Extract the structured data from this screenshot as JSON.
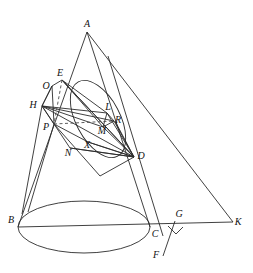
{
  "figure": {
    "stroke_color": "#2b2b2b",
    "dashed_color": "#4a4a4a",
    "background": "#ffffff",
    "stroke_width": 0.9,
    "width": 253,
    "height": 273
  },
  "points": {
    "A": {
      "label": "A",
      "x": 87,
      "y": 32,
      "lx": 87,
      "ly": 24
    },
    "B": {
      "label": "B",
      "x": 18,
      "y": 227,
      "lx": 11,
      "ly": 220
    },
    "C": {
      "label": "C",
      "x": 150,
      "y": 227,
      "lx": 155,
      "ly": 234
    },
    "D": {
      "label": "D",
      "x": 134,
      "y": 157,
      "lx": 141,
      "ly": 156
    },
    "E": {
      "label": "E",
      "x": 62,
      "y": 80,
      "lx": 60,
      "ly": 73
    },
    "F": {
      "label": "F",
      "x": 163,
      "y": 256,
      "lx": 156,
      "ly": 255
    },
    "G": {
      "label": "G",
      "x": 175,
      "y": 221,
      "lx": 179,
      "ly": 214
    },
    "H": {
      "label": "H",
      "x": 42,
      "y": 106,
      "lx": 33,
      "ly": 105
    },
    "K": {
      "label": "K",
      "x": 233,
      "y": 222,
      "lx": 238,
      "ly": 222
    },
    "L": {
      "label": "L",
      "x": 107,
      "y": 113,
      "lx": 108,
      "ly": 107
    },
    "M": {
      "label": "M",
      "x": 103,
      "y": 127,
      "lx": 102,
      "ly": 131
    },
    "N": {
      "label": "N",
      "x": 70,
      "y": 148,
      "lx": 68,
      "ly": 153
    },
    "O": {
      "label": "O",
      "x": 52,
      "y": 86,
      "lx": 46,
      "ly": 86
    },
    "P": {
      "label": "P",
      "x": 54,
      "y": 124,
      "lx": 46,
      "ly": 127
    },
    "R": {
      "label": "R",
      "x": 114,
      "y": 121,
      "lx": 118,
      "ly": 120
    },
    "X": {
      "label": "X",
      "x": 88,
      "y": 142,
      "lx": 87,
      "ly": 145
    }
  },
  "base_ellipse": {
    "name": "cone-base-ellipse",
    "cx": 84,
    "cy": 227,
    "rx": 66,
    "ry": 26
  },
  "sphere_ellipse": {
    "name": "inscribed-sphere-outline",
    "cx": 98,
    "cy": 119,
    "rx": 22,
    "ry": 42,
    "rotate": -28
  },
  "segments": [
    {
      "name": "cone-edge-left",
      "from": "A",
      "to": "B"
    },
    {
      "name": "cone-edge-right",
      "from": "A",
      "to": "C"
    },
    {
      "name": "cone-axis-to-K",
      "from": "A",
      "to": "K"
    },
    {
      "name": "base-diameter-BK",
      "from": "B",
      "to": "K"
    },
    {
      "name": "cutting-plane-edge-HD",
      "from": "H",
      "to": "D"
    },
    {
      "name": "cutting-plane-edge-HO",
      "from": "H",
      "to": "O"
    },
    {
      "name": "cutting-plane-edge-OE",
      "from": "O",
      "to": "E"
    },
    {
      "name": "cutting-plane-edge-ED",
      "from": "E",
      "to": "D"
    },
    {
      "name": "section-quad-HP",
      "from": "H",
      "to": "P"
    },
    {
      "name": "section-quad-PN",
      "from": "P",
      "to": "N"
    },
    {
      "name": "section-quad-ND",
      "from": "N",
      "to": "D"
    },
    {
      "name": "chord-ED-inner",
      "from": "E",
      "to": "D"
    },
    {
      "name": "chord-EM",
      "from": "E",
      "to": "M"
    },
    {
      "name": "chord-EL",
      "from": "E",
      "to": "L"
    },
    {
      "name": "chord-HL",
      "from": "H",
      "to": "L"
    },
    {
      "name": "chord-HM",
      "from": "H",
      "to": "M"
    },
    {
      "name": "chord-HR",
      "from": "H",
      "to": "R"
    },
    {
      "name": "chord-LD",
      "from": "L",
      "to": "D"
    },
    {
      "name": "chord-MD",
      "from": "M",
      "to": "D"
    },
    {
      "name": "chord-RD",
      "from": "R",
      "to": "D"
    },
    {
      "name": "chord-XD",
      "from": "X",
      "to": "D"
    },
    {
      "name": "chord-LM",
      "from": "L",
      "to": "M"
    },
    {
      "name": "chord-LR",
      "from": "L",
      "to": "R"
    },
    {
      "name": "chord-MR",
      "from": "M",
      "to": "R"
    },
    {
      "name": "generator-ND-extended",
      "from": "N",
      "to": "D"
    },
    {
      "name": "perpendicular-GF",
      "from": "G",
      "to": "F"
    }
  ],
  "polylines": [
    {
      "name": "section-parallelogram",
      "pts": "52,86 42,106 54,124 100,176 134,157 115,121"
    },
    {
      "name": "inner-quad-OPXD",
      "pts": "52,86 54,124 88,142 134,157"
    }
  ],
  "dashed_segments": [
    {
      "name": "dashed-axis-EP",
      "from": "E",
      "to": "P"
    },
    {
      "name": "dashed-chord-PR",
      "from": "P",
      "to": "R"
    }
  ],
  "right_angle_marker": {
    "name": "right-angle-at-G",
    "points": "168,226 176,234 183,227"
  },
  "cone_surface_lines": [
    {
      "name": "generator-through-D-to-base",
      "x1": 108,
      "y1": 56,
      "x2": 163,
      "y2": 236
    },
    {
      "name": "generator-P-to-base-left",
      "x1": 54,
      "y1": 124,
      "x2": 28,
      "y2": 212
    },
    {
      "name": "generator-H-to-base",
      "x1": 42,
      "y1": 106,
      "x2": 22,
      "y2": 214
    }
  ]
}
